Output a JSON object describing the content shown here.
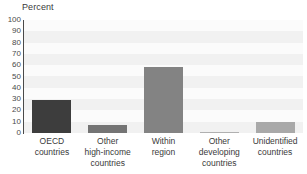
{
  "chart_data": {
    "type": "bar",
    "title": "",
    "subtitle": "",
    "xlabel": "",
    "ylabel": "Percent",
    "ylim": [
      0,
      100
    ],
    "ytick_labels": [
      "100",
      "90",
      "80",
      "70",
      "60",
      "50",
      "40",
      "30",
      "20",
      "10",
      "0"
    ],
    "ytick_values": [
      100,
      90,
      80,
      70,
      60,
      50,
      40,
      30,
      20,
      10,
      0
    ],
    "grid": "horizontal-bands",
    "legend": "none",
    "categories": [
      "OECD countries",
      "Other high-income countries",
      "Within region",
      "Other developing countries",
      "Unidentified countries"
    ],
    "category_lines": [
      [
        "OECD",
        "countries"
      ],
      [
        "Other",
        "high-income",
        "countries"
      ],
      [
        "Within",
        "region"
      ],
      [
        "Other",
        "developing",
        "countries"
      ],
      [
        "Unidentified",
        "countries"
      ]
    ],
    "values": [
      29,
      7,
      58,
      1,
      10
    ],
    "bar_colors": [
      "#3d3d3d",
      "#747474",
      "#838383",
      "#b0b0b0",
      "#a9a9a9"
    ],
    "plot_background": "#f1f1f1",
    "band_color": "#fbfbfb",
    "axis_color": "#4a4a4a",
    "text_color": "#3a3a3a"
  }
}
